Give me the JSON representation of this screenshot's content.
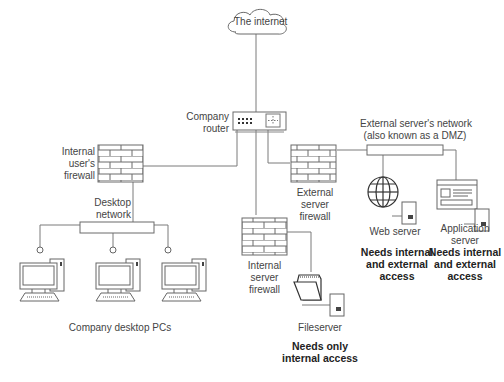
{
  "diagram": {
    "type": "network-topology",
    "nodes": {
      "internet": {
        "label": "The internet"
      },
      "router": {
        "label_line1": "Company",
        "label_line2": "router"
      },
      "internal_users_firewall": {
        "label_line1": "Internal",
        "label_line2": "user's",
        "label_line3": "firewall"
      },
      "desktop_network": {
        "label_line1": "Desktop",
        "label_line2": "network"
      },
      "desktop_pcs": {
        "label": "Company desktop PCs",
        "count": 3
      },
      "internal_server_firewall": {
        "label_line1": "Internal",
        "label_line2": "server",
        "label_line3": "firewall"
      },
      "fileserver": {
        "label": "Fileserver",
        "access_line1": "Needs only",
        "access_line2": "internal access"
      },
      "external_server_firewall": {
        "label_line1": "External",
        "label_line2": "server",
        "label_line3": "firewall"
      },
      "dmz": {
        "label_line1": "External server's network",
        "label_line2": "(also known as a DMZ)"
      },
      "web_server": {
        "label": "Web server",
        "access_line1": "Needs internal",
        "access_line2": "and external",
        "access_line3": "access"
      },
      "application_server": {
        "label_line1": "Application",
        "label_line2": "server",
        "access_line1": "Needs internal",
        "access_line2": "and external",
        "access_line3": "access"
      }
    },
    "edges": [
      [
        "internet",
        "router"
      ],
      [
        "router",
        "internal_users_firewall"
      ],
      [
        "router",
        "internal_server_firewall"
      ],
      [
        "router",
        "external_server_firewall"
      ],
      [
        "internal_users_firewall",
        "desktop_network"
      ],
      [
        "desktop_network",
        "desktop_pc_1"
      ],
      [
        "desktop_network",
        "desktop_pc_2"
      ],
      [
        "desktop_network",
        "desktop_pc_3"
      ],
      [
        "internal_server_firewall",
        "fileserver"
      ],
      [
        "external_server_firewall",
        "dmz"
      ],
      [
        "dmz",
        "web_server"
      ],
      [
        "dmz",
        "application_server"
      ]
    ],
    "colors": {
      "line": "#777777",
      "stroke": "#555555",
      "text": "#444444",
      "background": "#ffffff"
    }
  }
}
